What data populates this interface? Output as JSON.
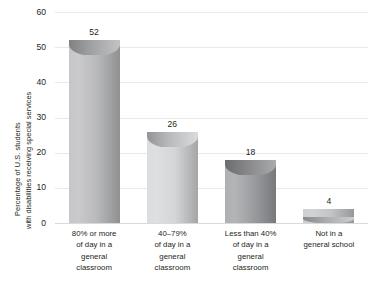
{
  "chart_data": {
    "type": "bar",
    "title": "",
    "subtitle": "",
    "xlabel": "",
    "ylabel": "Percentage of U.S. students with disabilities receiving special services",
    "ylabel_lines": [
      "Percentage of U.S. students",
      "with disabilities receiving special services"
    ],
    "categories": [
      "80% or more of day in a general classroom",
      "40–79% of day in a general classroom",
      "Less than 40% of day in a general classroom",
      "Not in a general school"
    ],
    "category_lines": [
      [
        "80% or more",
        "of day in a",
        "general",
        "classroom"
      ],
      [
        "40–79%",
        "of day in a",
        "general",
        "classroom"
      ],
      [
        "Less than 40%",
        "of day in a",
        "general",
        "classroom"
      ],
      [
        "Not in a",
        "general school"
      ]
    ],
    "values": [
      52,
      26,
      18,
      4
    ],
    "value_labels": [
      "52",
      "26",
      "18",
      "4"
    ],
    "ylim": [
      0,
      60
    ],
    "yticks": [
      0,
      10,
      20,
      30,
      40,
      50,
      60
    ],
    "ytick_labels": [
      "0",
      "10",
      "20",
      "30",
      "40",
      "50",
      "60"
    ],
    "grid": true,
    "legend": false,
    "legend_position": "none",
    "bar_style": "cylinder",
    "bar_colors": [
      "#b7b8ba",
      "#d3d4d6",
      "#9a9b9e",
      "#c2c3c5"
    ]
  },
  "colors": {
    "text": "#231f20",
    "gridline": "#e9e9ea",
    "baseline": "#d9d9da",
    "background": "#ffffff"
  }
}
